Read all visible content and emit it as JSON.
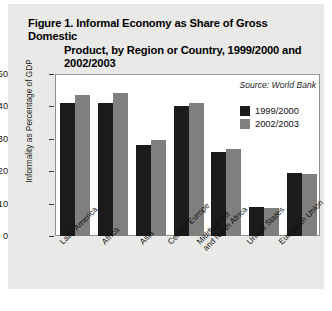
{
  "figure": {
    "title_line1": "Figure 1. Informal Economy as Share of Gross Domestic",
    "title_line2": "Product, by Region or Country, 1999/2000 and",
    "title_line3": "2002/2003",
    "source": "Source: World Bank"
  },
  "colors": {
    "series_1999_2000": "#1b1b1b",
    "series_2002_2003": "#7f7f7f",
    "card_background": "#e9e9e7",
    "plot_background": "#ffffff",
    "axis": "#8d8d8d"
  },
  "legend": {
    "position": "inside-top-right",
    "entries": [
      {
        "label": "1999/2000",
        "color": "#1b1b1b"
      },
      {
        "label": "2002/2003",
        "color": "#7f7f7f"
      }
    ]
  },
  "chart_data": {
    "type": "bar",
    "title": "Figure 1. Informal Economy as Share of Gross Domestic Product, by Region or Country, 1999/2000 and 2002/2003",
    "xlabel": "",
    "ylabel": "Informality as Percentage of GDP",
    "ylim": [
      0,
      50
    ],
    "yticks": [
      0,
      10,
      20,
      30,
      40,
      50
    ],
    "ytick_labels": [
      "0",
      "10",
      "20",
      "30",
      "40",
      "50"
    ],
    "grid": false,
    "legend_position": "upper right",
    "categories": [
      "Latin America",
      "Africa",
      "Asia",
      "Central Europe",
      "Middle East and North Africa",
      "United States",
      "European Union"
    ],
    "category_lines": [
      [
        "Latin America"
      ],
      [
        "Africa"
      ],
      [
        "Asia"
      ],
      [
        "Central Europe"
      ],
      [
        "Middle East",
        "and North Africa"
      ],
      [
        "United States"
      ],
      [
        "European Union"
      ]
    ],
    "series": [
      {
        "name": "1999/2000",
        "color": "#1b1b1b",
        "values": [
          41,
          41,
          28,
          40,
          26,
          9,
          19.5
        ]
      },
      {
        "name": "2002/2003",
        "color": "#7f7f7f",
        "values": [
          43.5,
          44,
          29.5,
          41,
          27,
          8.8,
          19
        ]
      }
    ],
    "annotations": [
      "Source: World Bank"
    ]
  }
}
